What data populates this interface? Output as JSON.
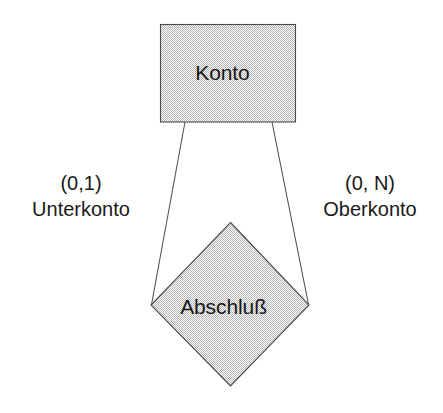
{
  "diagram": {
    "type": "entity-relationship-diagram",
    "notation": "Chen / (min,max) cardinality",
    "entity": {
      "label": "Konto",
      "shape": "rectangle"
    },
    "relationship": {
      "label": "Abschluß",
      "shape": "diamond"
    },
    "edges": [
      {
        "side": "left",
        "cardinality": "(0,1)",
        "role": "Unterkonto"
      },
      {
        "side": "right",
        "cardinality": "(0, N)",
        "role": "Oberkonto"
      }
    ],
    "style": {
      "fill": "#d9d9d9",
      "stroke": "#4a4a4a",
      "text": "#171717",
      "background": "#ffffff"
    }
  }
}
